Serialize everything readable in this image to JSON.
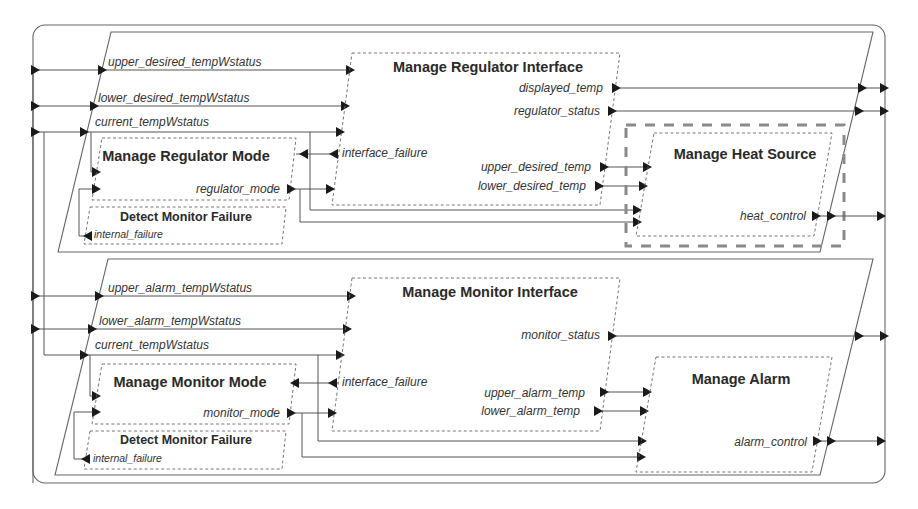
{
  "diagram": {
    "regulator": {
      "inputs": {
        "upper": "upper_desired_tempWstatus",
        "lower": "lower_desired_tempWstatus",
        "current": "current_tempWstatus"
      },
      "interface": {
        "title": "Manage Regulator Interface",
        "out_displayed": "displayed_temp",
        "out_status": "regulator_status",
        "in_failure": "interface_failure",
        "out_upper": "upper_desired_temp",
        "out_lower": "lower_desired_temp"
      },
      "mode": {
        "title": "Manage Regulator Mode",
        "out_mode": "regulator_mode"
      },
      "failure": {
        "title": "Detect Monitor Failure",
        "out_internal": "internal_failure"
      },
      "heat": {
        "title": "Manage Heat Source",
        "out_control": "heat_control"
      }
    },
    "monitor": {
      "inputs": {
        "upper": "upper_alarm_tempWstatus",
        "lower": "lower_alarm_tempWstatus",
        "current": "current_tempWstatus"
      },
      "interface": {
        "title": "Manage Monitor Interface",
        "out_status": "monitor_status",
        "in_failure": "interface_failure",
        "out_upper": "upper_alarm_temp",
        "out_lower": "lower_alarm_temp"
      },
      "mode": {
        "title": "Manage Monitor Mode",
        "out_mode": "monitor_mode"
      },
      "failure": {
        "title": "Detect Monitor Failure",
        "out_internal": "internal_failure"
      },
      "alarm": {
        "title": "Manage Alarm",
        "out_control": "alarm_control"
      }
    }
  }
}
